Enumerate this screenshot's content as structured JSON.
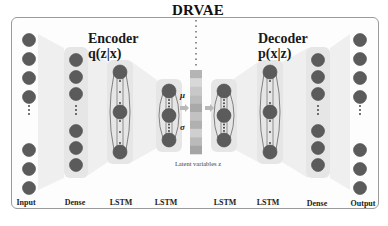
{
  "title": "DRVAE",
  "encoder": {
    "heading": "Encoder",
    "formula": "q(z|x)"
  },
  "decoder": {
    "heading": "Decoder",
    "formula": "p(x|z)"
  },
  "latent": {
    "caption": "Latent variables z",
    "mu_symbol": "μ",
    "sigma_symbol": "σ",
    "cells": 10
  },
  "layers": [
    {
      "id": "input",
      "label": "Input",
      "nodes_top": 4,
      "nodes_bottom": 3,
      "ellipsis": true,
      "boxed": false
    },
    {
      "id": "enc-dense",
      "label": "Dense",
      "nodes_top": 3,
      "nodes_bottom": 3,
      "ellipsis": true,
      "boxed": true
    },
    {
      "id": "enc-lstm-1",
      "label": "LSTM",
      "nodes": 3,
      "recurrent": true
    },
    {
      "id": "enc-lstm-2",
      "label": "LSTM",
      "nodes": 3,
      "recurrent": true
    },
    {
      "id": "dec-lstm-1",
      "label": "LSTM",
      "nodes": 3,
      "recurrent": true
    },
    {
      "id": "dec-lstm-2",
      "label": "LSTM",
      "nodes": 3,
      "recurrent": true
    },
    {
      "id": "dec-dense",
      "label": "Dense",
      "nodes_top": 3,
      "nodes_bottom": 3,
      "ellipsis": true,
      "boxed": true
    },
    {
      "id": "output",
      "label": "Output",
      "nodes_top": 4,
      "nodes_bottom": 3,
      "ellipsis": true,
      "boxed": false
    }
  ],
  "colors": {
    "node": "#5b5b5b",
    "node_edge": "#4a4a4a",
    "box": "#e6e6e6",
    "funnel": "#ececec",
    "arrow": "#b8b8b8",
    "latent_shades": [
      "#b4b4b4",
      "#d8d8d8",
      "#c8c8c8",
      "#bcbcbc",
      "#a9a9a9",
      "#c2c2c2",
      "#b0b0b0",
      "#cfcfcf",
      "#bababa",
      "#a5a5a5"
    ]
  }
}
